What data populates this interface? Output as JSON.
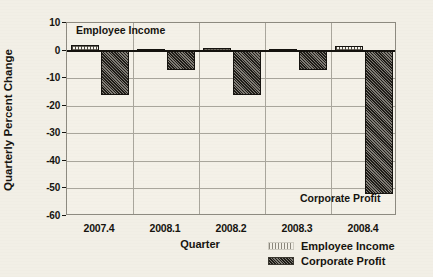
{
  "chart_data": {
    "type": "bar",
    "title": "",
    "xlabel": "Quarter",
    "ylabel": "Quarterly Percent Change",
    "categories": [
      "2007.4",
      "2008.1",
      "2008.2",
      "2008.3",
      "2008.4"
    ],
    "series": [
      {
        "name": "Employee Income",
        "values": [
          2,
          0.5,
          1,
          0.5,
          1.5
        ]
      },
      {
        "name": "Corporate Profit",
        "values": [
          -16,
          -7,
          -16,
          -7,
          -52
        ]
      }
    ],
    "ylim": [
      -60,
      10
    ],
    "yticks": [
      10,
      0,
      -10,
      -20,
      -30,
      -40,
      -50,
      -60
    ],
    "ytick_labels": [
      "10",
      "0",
      "-10",
      "-20",
      "-30",
      "-40",
      "-50",
      "-60"
    ],
    "grid": true,
    "legend_position": "bottom-right",
    "annotations": [
      {
        "text": "Employee Income",
        "target_series": "Employee Income"
      },
      {
        "text": "Corporate Profit",
        "target_series": "Corporate Profit"
      }
    ],
    "colors": {
      "employee_income": "#f7f5ee",
      "corporate_profit": "#5d5950",
      "axis": "#16140f",
      "grid": "#a9a69c",
      "background": "#f2efe6"
    }
  },
  "legend": {
    "items": [
      {
        "label": "Employee Income",
        "swatch": "income"
      },
      {
        "label": "Corporate Profit",
        "swatch": "profit"
      }
    ]
  }
}
